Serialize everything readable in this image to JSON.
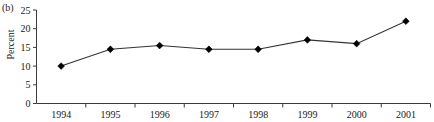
{
  "figure": {
    "panel_label": "(b)"
  },
  "chart_data": {
    "type": "line",
    "title": "",
    "subtitle": "",
    "xlabel": "",
    "ylabel": "Percent",
    "categories": [
      "1994",
      "1995",
      "1996",
      "1997",
      "1998",
      "1999",
      "2000",
      "2001"
    ],
    "values": [
      10,
      14.5,
      15.5,
      14.5,
      14.5,
      17,
      16,
      22
    ],
    "series": [
      {
        "name": "Percent",
        "values": [
          10,
          14.5,
          15.5,
          14.5,
          14.5,
          17,
          16,
          22
        ]
      }
    ],
    "ylim": [
      0,
      25
    ],
    "yticks": [
      0,
      5,
      10,
      15,
      20,
      25
    ],
    "ytick_labels": [
      "0",
      "5",
      "10",
      "15",
      "20",
      "25"
    ],
    "xtick_labels": [
      "1994",
      "1995",
      "1996",
      "1997",
      "1998",
      "1999",
      "2000",
      "2001"
    ],
    "grid": false,
    "legend": false,
    "legend_position": "none",
    "marker": "diamond",
    "line_color": "#333333",
    "marker_color": "#000000",
    "axis_color": "#3a3a3a"
  }
}
